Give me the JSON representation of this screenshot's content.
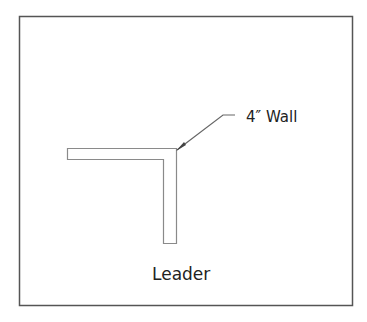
{
  "diagram": {
    "callout_label": "4″ Wall",
    "caption": "Leader",
    "colors": {
      "frame": "#555555",
      "wall": "#8a8a8a",
      "leader": "#666666",
      "text": "#222222"
    }
  }
}
